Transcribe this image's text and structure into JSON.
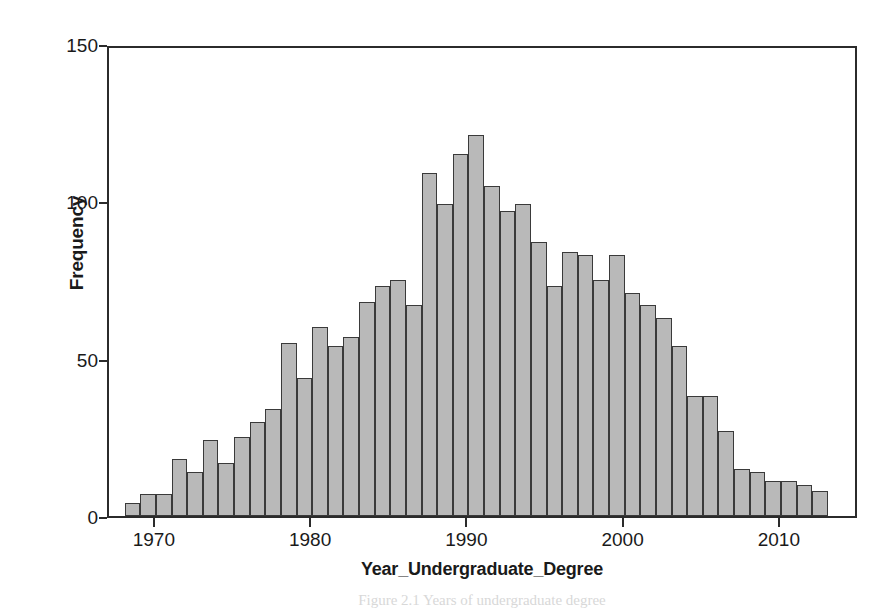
{
  "figure": {
    "caption": "Figure 2.1 Years of undergraduate degree"
  },
  "axes": {
    "y_label": "Frequency",
    "x_label": "Year_Undergraduate_Degree",
    "y_ticks": [
      "0",
      "50",
      "100",
      "150"
    ],
    "x_ticks": [
      "1970",
      "1980",
      "1990",
      "2000",
      "2010"
    ]
  },
  "chart_data": {
    "type": "bar",
    "title": "",
    "xlabel": "Year_Undergraduate_Degree",
    "ylabel": "Frequency",
    "xlim": [
      1967,
      2015
    ],
    "ylim": [
      0,
      150
    ],
    "ytick_values": [
      0,
      50,
      100,
      150
    ],
    "xtick_values": [
      1970,
      1980,
      1990,
      2000,
      2010
    ],
    "grid": false,
    "legend": "none",
    "bin_width": 1,
    "bar_fill_color": "#b9b9b9",
    "bar_edge_color": "#3a3a3a",
    "categories": [
      1968,
      1969,
      1970,
      1971,
      1972,
      1973,
      1974,
      1975,
      1976,
      1977,
      1978,
      1979,
      1980,
      1981,
      1982,
      1983,
      1984,
      1985,
      1986,
      1987,
      1988,
      1989,
      1990,
      1991,
      1992,
      1993,
      1994,
      1995,
      1996,
      1997,
      1998,
      1999,
      2000,
      2001,
      2002,
      2003,
      2004,
      2005,
      2006,
      2007,
      2008,
      2009,
      2010,
      2011,
      2012,
      2013,
      2014
    ],
    "values": [
      4,
      7,
      7,
      18,
      14,
      24,
      17,
      25,
      30,
      34,
      55,
      44,
      60,
      54,
      57,
      68,
      73,
      75,
      67,
      109,
      99,
      115,
      121,
      105,
      97,
      99,
      87,
      73,
      84,
      83,
      75,
      83,
      71,
      67,
      63,
      54,
      38,
      38,
      27,
      15,
      14,
      11,
      11,
      10,
      8,
      0,
      0
    ]
  }
}
